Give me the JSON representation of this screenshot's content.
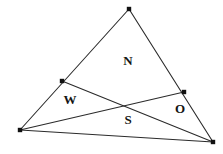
{
  "figure": {
    "type": "geometric-diagram",
    "canvas": {
      "width": 223,
      "height": 154
    },
    "colors": {
      "background": "#ffffff",
      "stroke": "#2b2b2b",
      "vertex_dot": "#111111",
      "label_text": "#141414"
    },
    "stroke_width": 1.1,
    "vertex_dot_radius": 2.2
  },
  "points": [
    {
      "id": "A",
      "name": "apex-vertex",
      "x": 129,
      "y": 9
    },
    {
      "id": "B",
      "name": "bottom-left-vertex",
      "x": 20,
      "y": 130
    },
    {
      "id": "C",
      "name": "bottom-right-vertex",
      "x": 213,
      "y": 142
    },
    {
      "id": "P",
      "name": "point-on-left-side",
      "x": 62,
      "y": 81
    },
    {
      "id": "Q",
      "name": "point-on-right-side",
      "x": 184,
      "y": 92
    }
  ],
  "segments": [
    {
      "id": "AB",
      "name": "triangle-side-left",
      "x1": 129,
      "y1": 9,
      "x2": 20,
      "y2": 130
    },
    {
      "id": "AC",
      "name": "triangle-side-right",
      "x1": 129,
      "y1": 9,
      "x2": 213,
      "y2": 142
    },
    {
      "id": "BC",
      "name": "triangle-side-bottom",
      "x1": 20,
      "y1": 130,
      "x2": 213,
      "y2": 142
    },
    {
      "id": "BQ",
      "name": "cevian-bottom-left-to-right-side",
      "x1": 20,
      "y1": 130,
      "x2": 184,
      "y2": 92
    },
    {
      "id": "PC",
      "name": "cevian-left-side-to-bottom-right",
      "x1": 62,
      "y1": 81,
      "x2": 213,
      "y2": 142
    }
  ],
  "labels": [
    {
      "id": "N",
      "text": "N",
      "name": "region-label-n",
      "x": 128,
      "y": 60
    },
    {
      "id": "W",
      "text": "W",
      "name": "region-label-w",
      "x": 70,
      "y": 99
    },
    {
      "id": "O",
      "text": "O",
      "name": "region-label-o",
      "x": 180,
      "y": 108
    },
    {
      "id": "S",
      "text": "S",
      "name": "region-label-s",
      "x": 128,
      "y": 119
    }
  ]
}
